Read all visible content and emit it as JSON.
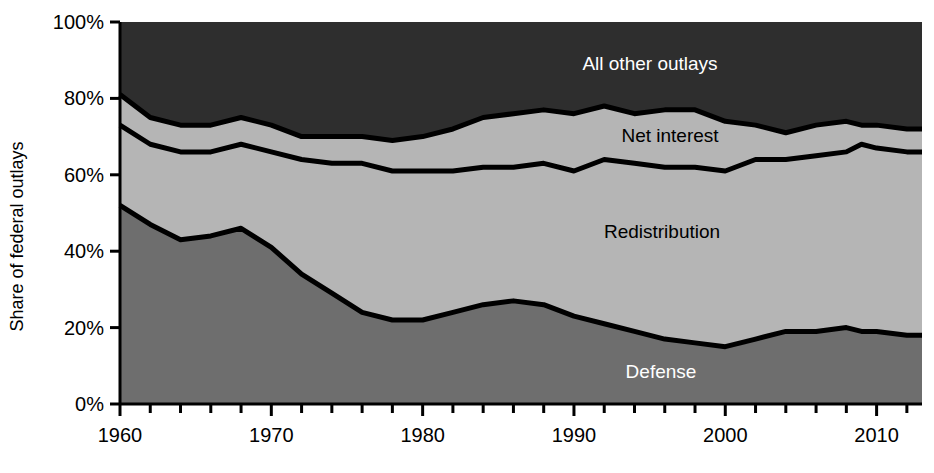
{
  "chart_data": {
    "type": "area",
    "stacked": true,
    "title": "",
    "xlabel": "",
    "ylabel": "Share of federal outlays",
    "xlim": [
      1960,
      2013
    ],
    "ylim": [
      0,
      100
    ],
    "grid": false,
    "legend_position": "inline-labels",
    "y_tick_labels": [
      "0%",
      "20%",
      "40%",
      "60%",
      "80%",
      "100%"
    ],
    "y_ticks": [
      0,
      20,
      40,
      60,
      80,
      100
    ],
    "x_tick_labels": [
      "1960",
      "1970",
      "1980",
      "1990",
      "2000",
      "2010"
    ],
    "x_major_ticks": [
      1960,
      1970,
      1980,
      1990,
      2000,
      2010
    ],
    "x_minor_tick_interval": 2,
    "colors": {
      "defense": "#6e6e6e",
      "redistribution": "#b5b5b5",
      "net_interest": "#b5b5b5",
      "all_other_outlays": "#2e2e2e",
      "boundary_line": "#000000",
      "axis": "#000000",
      "background": "#ffffff"
    },
    "x": [
      1960,
      1962,
      1964,
      1966,
      1968,
      1970,
      1972,
      1974,
      1976,
      1978,
      1980,
      1982,
      1984,
      1986,
      1988,
      1990,
      1992,
      1994,
      1996,
      1998,
      2000,
      2002,
      2004,
      2006,
      2008,
      2009,
      2010,
      2012,
      2013
    ],
    "series": [
      {
        "name": "Defense",
        "label": "Defense",
        "label_color": "#ffffff",
        "values": [
          52,
          47,
          43,
          44,
          46,
          41,
          34,
          29,
          24,
          22,
          22,
          24,
          26,
          27,
          26,
          23,
          21,
          19,
          17,
          16,
          15,
          17,
          19,
          19,
          20,
          19,
          19,
          18,
          18
        ]
      },
      {
        "name": "Redistribution",
        "label": "Redistribution",
        "label_color": "#000000",
        "values": [
          21,
          21,
          23,
          22,
          22,
          25,
          30,
          34,
          39,
          39,
          39,
          37,
          36,
          35,
          37,
          38,
          43,
          44,
          45,
          46,
          46,
          47,
          45,
          46,
          46,
          49,
          48,
          48,
          48
        ]
      },
      {
        "name": "Net interest",
        "label": "Net interest",
        "label_color": "#000000",
        "values": [
          8,
          7,
          7,
          7,
          7,
          7,
          6,
          7,
          7,
          8,
          9,
          11,
          13,
          14,
          14,
          15,
          14,
          13,
          15,
          15,
          13,
          9,
          7,
          8,
          8,
          5,
          6,
          6,
          6
        ]
      },
      {
        "name": "All other outlays",
        "label": "All other outlays",
        "label_color": "#ffffff",
        "values": [
          19,
          25,
          27,
          27,
          25,
          27,
          30,
          30,
          30,
          31,
          30,
          28,
          25,
          24,
          23,
          24,
          22,
          24,
          23,
          23,
          26,
          27,
          29,
          27,
          26,
          27,
          27,
          28,
          28
        ]
      }
    ],
    "inline_labels": [
      {
        "text": "All other outlays",
        "x_px": 650,
        "y_px": 64,
        "style": "light"
      },
      {
        "text": "Net interest",
        "x_px": 670,
        "y_px": 136,
        "style": "dark"
      },
      {
        "text": "Redistribution",
        "x_px": 662,
        "y_px": 232,
        "style": "dark"
      },
      {
        "text": "Defense",
        "x_px": 661,
        "y_px": 372,
        "style": "light"
      }
    ]
  }
}
